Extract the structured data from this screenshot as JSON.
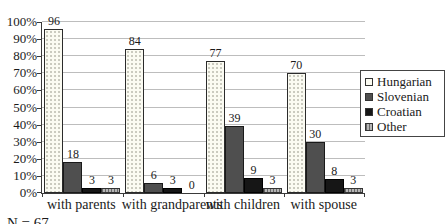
{
  "chart_data": {
    "type": "bar",
    "title": "",
    "categories": [
      "with parents",
      "with grandparents",
      "with children",
      "with spouse"
    ],
    "series": [
      {
        "name": "Hungarian",
        "values": [
          96,
          84,
          77,
          70
        ]
      },
      {
        "name": "Slovenian",
        "values": [
          18,
          6,
          39,
          30
        ]
      },
      {
        "name": "Croatian",
        "values": [
          3,
          3,
          9,
          8
        ]
      },
      {
        "name": "Other",
        "values": [
          3,
          0,
          3,
          3
        ]
      }
    ],
    "xlabel": "",
    "ylabel": "",
    "ylim": [
      0,
      100
    ],
    "y_tick_labels": [
      "0%",
      "10%",
      "20%",
      "30%",
      "40%",
      "50%",
      "60%",
      "70%",
      "80%",
      "90%",
      "100%"
    ],
    "grid": true,
    "legend_position": "right",
    "value_labels": true
  },
  "footnote": "N = 67",
  "colors": {
    "hungarian_fill": "#fbfbf2",
    "hungarian_dot": "#c9c9bd",
    "slovenian_fill": "#4f4f4f",
    "croatian_fill": "#161616",
    "other_stripe_dark": "#666666",
    "other_stripe_light": "#b5b5b5",
    "gridline": "#bdbdbd"
  }
}
